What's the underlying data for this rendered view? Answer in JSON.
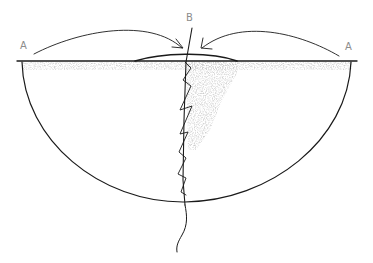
{
  "diagram": {
    "type": "hand-drawn semicircle sketch",
    "labels": {
      "left": "A",
      "right": "A",
      "top": "B"
    },
    "elements": [
      "horizontal diameter line with shaded band beneath",
      "semicircular bowl below line",
      "two curved arrows from each A toward center B",
      "lens-shaped bulge on top of line at center",
      "vertical line through B with zigzag stitch pattern",
      "wavy tail extending below the bowl"
    ],
    "colors": {
      "ink": "#1a1a1a",
      "label": "#8c8c8c",
      "shading": "#c8c8c8",
      "background": "#ffffff"
    }
  }
}
